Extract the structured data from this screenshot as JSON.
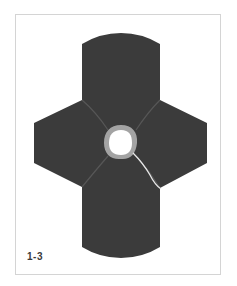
{
  "figure": {
    "label": "1-3",
    "colors": {
      "shape_fill": "#3b3b3b",
      "seam_lines": "#555555",
      "ring": "#a3a3a3",
      "hole": "#ffffff",
      "thread": "#e8e8e8",
      "frame_border": "#d4d4d4"
    }
  }
}
